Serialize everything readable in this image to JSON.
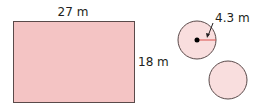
{
  "diagram": {
    "rectangle": {
      "width_label": "27 m",
      "height_label": "18 m",
      "fill": "#f4c4c4",
      "stroke": "#5a4a4a"
    },
    "circle_top": {
      "radius_label": "4.3 m",
      "fill": "#f9dede",
      "stroke": "#5a4a4a",
      "radius_line_color": "#d9534f"
    },
    "circle_bottom": {
      "fill": "#f9dede",
      "stroke": "#5a4a4a"
    }
  }
}
